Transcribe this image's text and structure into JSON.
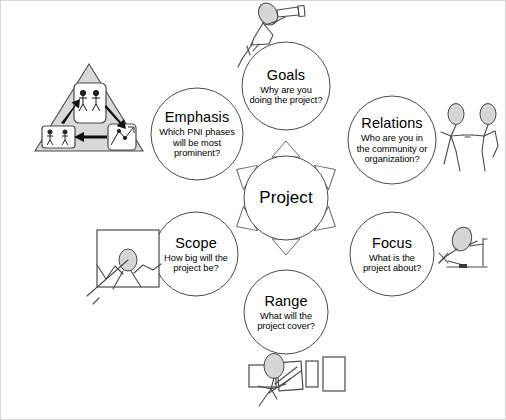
{
  "diagram": {
    "center": {
      "id": "project",
      "label": "Project",
      "description": ""
    },
    "nodes": [
      {
        "id": "goals",
        "label": "Goals",
        "description": "Why are you doing the project?",
        "illustration": "stick-figure-with-telescope-icon"
      },
      {
        "id": "relations",
        "label": "Relations",
        "description": "Who are you in the community or organization?",
        "illustration": "two-stick-figures-holding-hands-icon"
      },
      {
        "id": "focus",
        "label": "Focus",
        "description": "What is the project about?",
        "illustration": "stick-figure-with-magnifying-glass-icon"
      },
      {
        "id": "range",
        "label": "Range",
        "description": "What will the project cover?",
        "illustration": "stick-figure-with-panels-icon"
      },
      {
        "id": "scope",
        "label": "Scope",
        "description": "How big will the project be?",
        "illustration": "stick-figure-in-frame-icon"
      },
      {
        "id": "emphasis",
        "label": "Emphasis",
        "description": "Which PNI phases will be most prominent?",
        "illustration": "triangle-with-three-phase-boxes-icon"
      }
    ],
    "arrows": [
      {
        "id": "arrow-to-goals",
        "direction": "up"
      },
      {
        "id": "arrow-to-relations",
        "direction": "up-right"
      },
      {
        "id": "arrow-to-focus",
        "direction": "down-right"
      },
      {
        "id": "arrow-to-range",
        "direction": "down"
      },
      {
        "id": "arrow-to-scope",
        "direction": "down-left"
      },
      {
        "id": "arrow-to-emphasis",
        "direction": "up-left"
      }
    ],
    "colors": {
      "stroke": "#3a3a3a",
      "background": "#ffffff",
      "fill_gray": "#d9d9d9",
      "border": "#d8d8d8"
    }
  }
}
